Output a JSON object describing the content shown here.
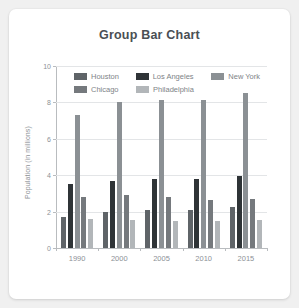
{
  "card": {
    "title": "Group Bar Chart"
  },
  "chart_data": {
    "type": "bar",
    "title": "Group Bar Chart",
    "xlabel": "",
    "ylabel": "Population (in millions)",
    "categories": [
      "1990",
      "2000",
      "2005",
      "2010",
      "2015"
    ],
    "ylim": [
      0,
      10
    ],
    "yticks": [
      0,
      2,
      4,
      6,
      8,
      10
    ],
    "grid": true,
    "legend_position": "upper-left-inside",
    "series": [
      {
        "name": "Houston",
        "color": "#5f6468",
        "values": [
          1.7,
          1.97,
          2.07,
          2.08,
          2.27
        ]
      },
      {
        "name": "Los Angeles",
        "color": "#2f3437",
        "values": [
          3.49,
          3.69,
          3.79,
          3.77,
          3.93
        ]
      },
      {
        "name": "New York",
        "color": "#8b9094",
        "values": [
          7.32,
          8.01,
          8.16,
          8.14,
          8.49
        ]
      },
      {
        "name": "Chicago",
        "color": "#75797d",
        "values": [
          2.78,
          2.89,
          2.79,
          2.66,
          2.69
        ]
      },
      {
        "name": "Philadelphia",
        "color": "#b2b6b9",
        "values": [
          1.59,
          1.52,
          1.5,
          1.5,
          1.55
        ]
      }
    ]
  }
}
